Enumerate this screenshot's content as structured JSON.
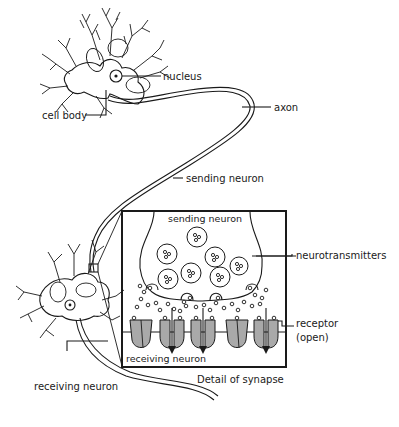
{
  "diagram": {
    "labels": {
      "nucleus": "nucleus",
      "cell_body": "cell body",
      "axon": "axon",
      "sending_neuron": "sending neuron",
      "receiving_neuron": "receiving neuron",
      "inset_sending_neuron": "sending neuron",
      "neurotransmitters": "neurotransmitters",
      "receptor": "receptor",
      "receptor_state": "(open)",
      "inset_receiving_neuron": "receiving neuron",
      "inset_caption": "Detail of synapse"
    },
    "colors": {
      "ink": "#1a1a1a",
      "receptor_fill": "#a9a9a9",
      "background": "#ffffff"
    }
  }
}
